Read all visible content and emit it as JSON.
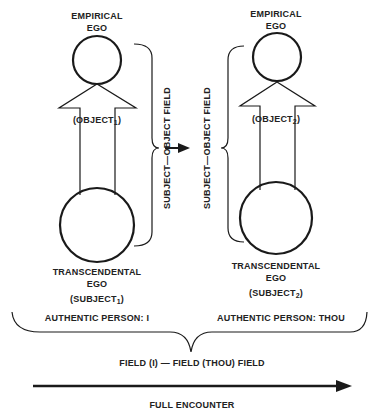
{
  "left_person": {
    "top_label_line1": "EMPIRICAL",
    "top_label_line2": "EGO",
    "object_label": "(OBJECT",
    "object_sub": "1",
    "object_close": ")",
    "bottom_label_line1": "TRANSCENDENTAL",
    "bottom_label_line2": "EGO",
    "subject_label": "(SUBJECT",
    "subject_sub": "1",
    "subject_close": ")",
    "field_label": "SUBJECT—OBJECT FIELD",
    "person_label": "AUTHENTIC PERSON: I"
  },
  "right_person": {
    "top_label_line1": "EMPIRICAL",
    "top_label_line2": "EGO",
    "object_label": "(OBJECT",
    "object_sub": "2",
    "object_close": ")",
    "bottom_label_line1": "TRANSCENDENTAL",
    "bottom_label_line2": "EGO",
    "subject_label": "(SUBJECT",
    "subject_sub": "2",
    "subject_close": ")",
    "field_label": "SUBJECT—OBJECT FIELD",
    "person_label": "AUTHENTIC PERSON: THOU"
  },
  "combined_field_label": "FIELD (I) — FIELD (THOU) FIELD",
  "bottom_caption": "FULL ENCOUNTER",
  "colors": {
    "ink": "#1a1a1a",
    "background": "#ffffff"
  }
}
